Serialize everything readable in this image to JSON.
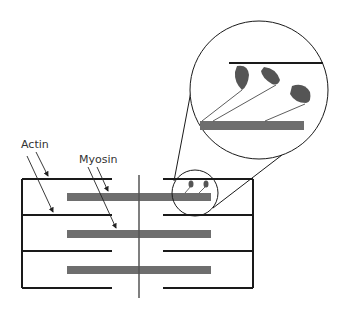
{
  "diagram": {
    "labels": {
      "actin": "Actin",
      "myosin": "Myosin"
    },
    "colors": {
      "line": "#1a1a1a",
      "myosin": "#6e6e6e",
      "head": "#555555"
    }
  }
}
